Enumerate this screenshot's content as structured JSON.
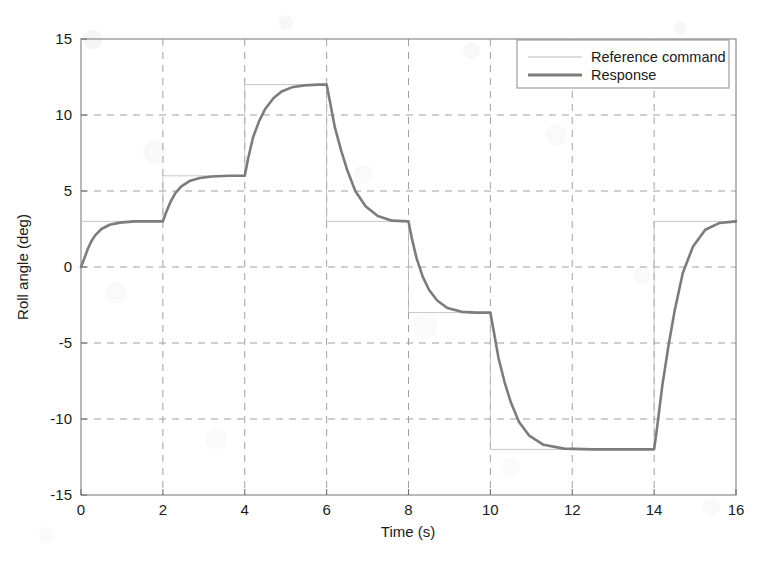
{
  "figure": {
    "background_color": "#ffffff",
    "plot_frame_color": "#8a8a8a",
    "grid_color": "#9a9a9a",
    "axis_label_color": "#1b1b1b"
  },
  "chart_data": {
    "type": "line",
    "title": "",
    "xlabel": "Time (s)",
    "ylabel": "Roll angle (deg)",
    "xlim": [
      0,
      16
    ],
    "ylim": [
      -15,
      15
    ],
    "xticks": [
      0,
      2,
      4,
      6,
      8,
      10,
      12,
      14,
      16
    ],
    "yticks": [
      -15,
      -10,
      -5,
      0,
      5,
      10,
      15
    ],
    "xtick_labels": [
      "0",
      "2",
      "4",
      "6",
      "8",
      "10",
      "12",
      "14",
      "16"
    ],
    "ytick_labels": [
      "-15",
      "-10",
      "-5",
      "0",
      "5",
      "10",
      "15"
    ],
    "grid": true,
    "grid_style": "dashed",
    "legend_position": "upper right",
    "series": [
      {
        "name": "Reference command",
        "color": "#b9b9b9",
        "line_width": 0.8,
        "style": "step",
        "description": "Ideal commanded roll angle staircase",
        "steps": [
          {
            "t_start": 0,
            "t_end": 2,
            "value": 3
          },
          {
            "t_start": 2,
            "t_end": 4,
            "value": 6
          },
          {
            "t_start": 4,
            "t_end": 6,
            "value": 12
          },
          {
            "t_start": 6,
            "t_end": 8,
            "value": 3
          },
          {
            "t_start": 8,
            "t_end": 10,
            "value": -3
          },
          {
            "t_start": 10,
            "t_end": 14,
            "value": -12
          },
          {
            "t_start": 14,
            "t_end": 16,
            "value": 3
          }
        ],
        "x": [
          0,
          2,
          2,
          4,
          4,
          6,
          6,
          8,
          8,
          10,
          10,
          14,
          14,
          16
        ],
        "y": [
          3,
          3,
          6,
          6,
          12,
          12,
          3,
          3,
          -3,
          -3,
          -12,
          -12,
          3,
          3
        ]
      },
      {
        "name": "Response",
        "color": "#7c7c7c",
        "line_width": 2.6,
        "style": "solid",
        "description": "Measured roll angle tracking the command with first-order lag",
        "x": [
          0,
          0.08,
          0.16,
          0.25,
          0.35,
          0.5,
          0.7,
          0.95,
          1.3,
          1.7,
          2,
          2.08,
          2.18,
          2.3,
          2.45,
          2.65,
          2.9,
          3.2,
          3.6,
          4,
          4.08,
          4.2,
          4.35,
          4.5,
          4.7,
          4.9,
          5.15,
          5.45,
          5.8,
          6,
          6.08,
          6.2,
          6.35,
          6.5,
          6.7,
          6.95,
          7.25,
          7.6,
          8,
          8.08,
          8.2,
          8.35,
          8.5,
          8.7,
          8.95,
          9.3,
          9.65,
          10,
          10.08,
          10.2,
          10.35,
          10.5,
          10.7,
          10.95,
          11.3,
          11.8,
          12.5,
          13.2,
          14,
          14.08,
          14.2,
          14.35,
          14.5,
          14.7,
          14.95,
          15.25,
          15.6,
          16
        ],
        "y": [
          0,
          0.55,
          1.15,
          1.68,
          2.1,
          2.5,
          2.78,
          2.92,
          3.0,
          3.0,
          3.0,
          3.6,
          4.25,
          4.85,
          5.3,
          5.65,
          5.85,
          5.95,
          6.0,
          6.0,
          7.1,
          8.5,
          9.6,
          10.4,
          11.1,
          11.55,
          11.82,
          11.95,
          12.0,
          12.0,
          10.9,
          9.2,
          7.7,
          6.4,
          5.0,
          4.0,
          3.35,
          3.05,
          3.0,
          1.9,
          0.55,
          -0.65,
          -1.5,
          -2.2,
          -2.7,
          -2.95,
          -3.0,
          -3.0,
          -4.2,
          -6.0,
          -7.6,
          -8.9,
          -10.2,
          -11.1,
          -11.7,
          -11.95,
          -12.0,
          -12.0,
          -12.0,
          -10.4,
          -7.8,
          -5.2,
          -2.9,
          -0.4,
          1.35,
          2.45,
          2.9,
          3.0
        ]
      }
    ]
  },
  "legend": {
    "items": [
      {
        "label": "Reference command",
        "swatch": "thin-line-swatch"
      },
      {
        "label": "Response",
        "swatch": "thick-line-swatch"
      }
    ]
  }
}
